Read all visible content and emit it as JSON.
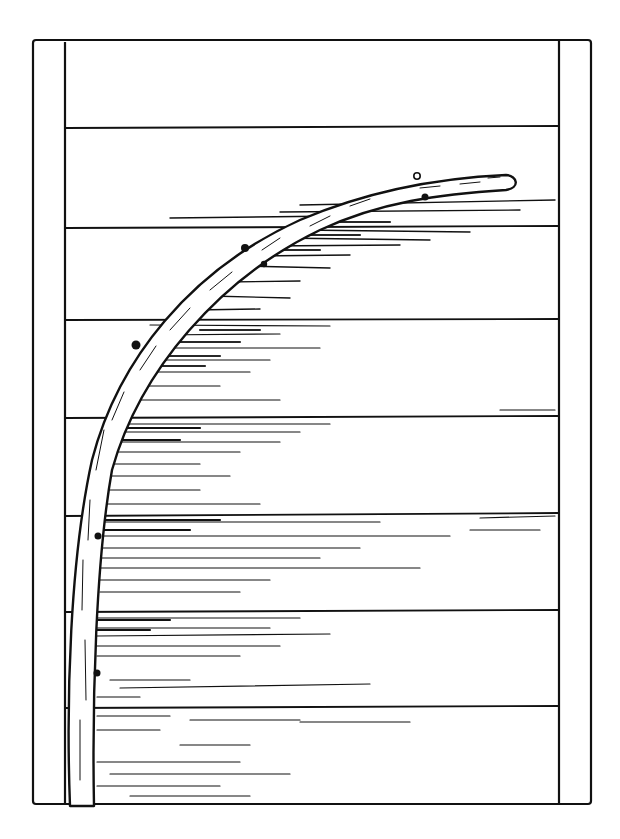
{
  "illustration": {
    "title": "Line drawing of a curved branch nailed across a wooden plank wall between two posts",
    "colors": {
      "ink": "#111111",
      "paper": "#ffffff"
    },
    "frame": {
      "left": 33,
      "top": 38,
      "right": 592,
      "bottom": 805,
      "post_width": 32
    },
    "plank_lines_y": [
      128,
      228,
      320,
      418,
      515,
      612,
      708
    ],
    "nails": [
      {
        "x": 417,
        "y": 176
      },
      {
        "x": 425,
        "y": 197
      },
      {
        "x": 245,
        "y": 248
      },
      {
        "x": 264,
        "y": 264
      },
      {
        "x": 136,
        "y": 345
      },
      {
        "x": 98,
        "y": 536
      },
      {
        "x": 97,
        "y": 673
      }
    ]
  }
}
